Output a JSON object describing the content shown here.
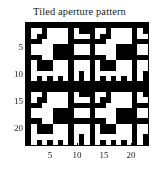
{
  "figure": {
    "title": "Tiled aperture pattern",
    "background_color": "#ffffff",
    "foreground_color": "#000000"
  },
  "chart_data": {
    "type": "heatmap",
    "title": "Tiled aperture pattern",
    "xlabel": "",
    "ylabel": "",
    "xlim": [
      0.5,
      23.5
    ],
    "ylim": [
      0.5,
      23.5
    ],
    "grid": false,
    "legend": null,
    "colormap": "binary",
    "color_low": "#000000",
    "color_high": "#ffffff",
    "x_ticks": [
      5,
      10,
      15,
      20
    ],
    "y_ticks": [
      5,
      10,
      15,
      20
    ],
    "x_tick_labels": [
      "5",
      "10",
      "15",
      "20"
    ],
    "y_tick_labels": [
      "5",
      "10",
      "15",
      "20"
    ],
    "y_axis_direction": "reversed",
    "n_rows": 23,
    "n_cols": 23,
    "tiling": {
      "rows": 2,
      "cols": 2,
      "base_tile_rows": 12,
      "base_tile_cols": 12,
      "description": "2 by 2 tiling of a 12 by 12 binary aperture tile"
    },
    "base_tile": [
      [
        0,
        0,
        0,
        0,
        0,
        0,
        0,
        0,
        0,
        0,
        0,
        0
      ],
      [
        0,
        1,
        1,
        0,
        1,
        1,
        1,
        1,
        0,
        1,
        0,
        0
      ],
      [
        0,
        1,
        0,
        0,
        1,
        1,
        1,
        1,
        0,
        1,
        1,
        1
      ],
      [
        0,
        0,
        0,
        1,
        1,
        1,
        1,
        1,
        0,
        0,
        0,
        0
      ],
      [
        0,
        1,
        1,
        1,
        1,
        0,
        0,
        0,
        0,
        1,
        1,
        1
      ],
      [
        0,
        1,
        1,
        1,
        1,
        0,
        0,
        0,
        0,
        1,
        1,
        1
      ],
      [
        0,
        0,
        0,
        1,
        1,
        0,
        0,
        0,
        0,
        0,
        0,
        0
      ],
      [
        0,
        1,
        0,
        0,
        0,
        1,
        1,
        1,
        0,
        1,
        1,
        1
      ],
      [
        0,
        1,
        0,
        0,
        0,
        1,
        1,
        1,
        0,
        1,
        1,
        1
      ],
      [
        0,
        1,
        1,
        1,
        1,
        1,
        1,
        1,
        0,
        1,
        0,
        1
      ],
      [
        0,
        1,
        0,
        1,
        0,
        1,
        0,
        1,
        0,
        1,
        0,
        1
      ],
      [
        0,
        0,
        0,
        0,
        0,
        0,
        0,
        0,
        0,
        0,
        0,
        0
      ]
    ],
    "values_note": "1 = white (open aperture), 0 = black (blocked)"
  },
  "axes": {
    "x_tick_labels": [
      "5",
      "10",
      "15",
      "20"
    ],
    "y_tick_labels": [
      "5",
      "10",
      "15",
      "20"
    ]
  }
}
